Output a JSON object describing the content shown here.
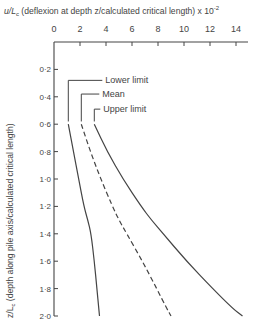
{
  "chart_data": {
    "type": "line",
    "title": "",
    "xlabel_prefix": "u/L",
    "xlabel_sub": "c",
    "xlabel_text": " (deflexion at depth z/calculated critical length) x 10",
    "xlabel_exp": "-2",
    "ylabel_prefix": "z/L",
    "ylabel_sub": "c",
    "ylabel_text": " (depth along pile axis/calculated critical length)",
    "x_ticks": [
      "0",
      "2",
      "4",
      "6",
      "8",
      "10",
      "12",
      "14"
    ],
    "x_tick_values": [
      0,
      2,
      4,
      6,
      8,
      10,
      12,
      14
    ],
    "y_ticks": [
      "0·2",
      "0·4",
      "0·6",
      "0·8",
      "1·0",
      "1·2",
      "1·4",
      "1·6",
      "1·8",
      "2·0"
    ],
    "y_tick_values": [
      0.2,
      0.4,
      0.6,
      0.8,
      1.0,
      1.2,
      1.4,
      1.6,
      1.8,
      2.0
    ],
    "xlim": [
      0,
      15
    ],
    "ylim": [
      0,
      2.0
    ],
    "x_axis_position": "top",
    "y_inverted": true,
    "grid": false,
    "series": [
      {
        "name": "Lower limit",
        "style": "solid",
        "x": [
          1.1,
          1.5,
          1.9,
          2.3,
          2.6,
          2.85,
          3.1,
          3.3,
          3.45,
          3.5
        ],
        "y": [
          0.6,
          0.8,
          1.0,
          1.2,
          1.3,
          1.4,
          1.6,
          1.8,
          1.95,
          2.0
        ]
      },
      {
        "name": "Mean",
        "style": "dashed",
        "x": [
          2.1,
          2.8,
          3.6,
          4.5,
          5.0,
          5.6,
          6.8,
          7.9,
          8.7,
          9.0
        ],
        "y": [
          0.6,
          0.8,
          1.0,
          1.2,
          1.3,
          1.4,
          1.6,
          1.8,
          1.95,
          2.0
        ]
      },
      {
        "name": "Upper limit",
        "style": "solid",
        "x": [
          3.1,
          4.1,
          5.3,
          6.7,
          7.5,
          8.4,
          10.2,
          12.2,
          13.8,
          14.5
        ],
        "y": [
          0.6,
          0.8,
          1.0,
          1.2,
          1.3,
          1.4,
          1.6,
          1.8,
          1.95,
          2.0
        ]
      }
    ],
    "annotations": [
      {
        "text": "Lower limit",
        "leader_x": 1.1,
        "label_y": 0.28
      },
      {
        "text": "Mean",
        "leader_x": 2.1,
        "label_y": 0.38
      },
      {
        "text": "Upper limit",
        "leader_x": 3.1,
        "label_y": 0.49
      }
    ]
  }
}
